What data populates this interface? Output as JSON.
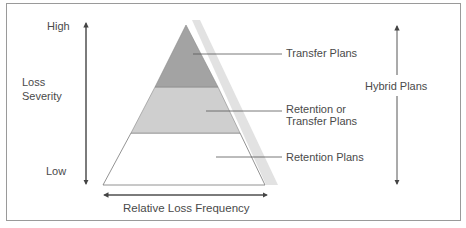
{
  "diagram": {
    "y_axis": {
      "high_label": "High",
      "title_line1": "Loss",
      "title_line2": "Severity",
      "low_label": "Low"
    },
    "x_axis": {
      "title": "Relative Loss Frequency"
    },
    "pyramid": {
      "layers": [
        {
          "name": "Transfer Plans",
          "line1": "Transfer Plans",
          "fill": "#a3a3a3"
        },
        {
          "name": "Retention or Transfer Plans",
          "line1": "Retention or",
          "line2": "Transfer Plans",
          "fill": "#cfcfcf"
        },
        {
          "name": "Retention Plans",
          "line1": "Retention Plans",
          "fill": "#ffffff"
        }
      ],
      "shadow_color": "#e2e2e2"
    },
    "right_axis": {
      "label": "Hybrid Plans"
    }
  }
}
